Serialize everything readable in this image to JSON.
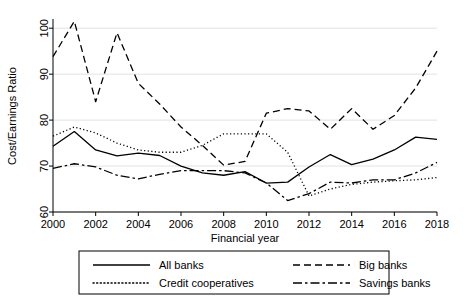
{
  "chart_data": {
    "type": "line",
    "title": "",
    "subtitle": "",
    "xlabel": "Financial year",
    "ylabel": "Cost/Earnings Ratio",
    "xlim": [
      2000,
      2018
    ],
    "ylim": [
      60,
      102
    ],
    "xticks": [
      2000,
      2002,
      2004,
      2006,
      2008,
      2010,
      2012,
      2014,
      2016,
      2018
    ],
    "yticks": [
      60,
      70,
      80,
      90,
      100
    ],
    "grid": "horizontal",
    "legend_position": "bottom-outside",
    "x": [
      2000,
      2001,
      2002,
      2003,
      2004,
      2005,
      2006,
      2007,
      2008,
      2009,
      2010,
      2011,
      2012,
      2013,
      2014,
      2015,
      2016,
      2017,
      2018
    ],
    "series": [
      {
        "name": "All banks",
        "style": "solid",
        "values": [
          74.3,
          77.5,
          73.5,
          72.2,
          72.8,
          72.3,
          70.0,
          68.5,
          68.0,
          68.8,
          66.3,
          66.5,
          69.8,
          72.5,
          70.3,
          71.5,
          73.5,
          76.3,
          75.8
        ]
      },
      {
        "name": "Big banks",
        "style": "dashed",
        "values": [
          93.8,
          101.5,
          84.0,
          99.0,
          88.0,
          83.5,
          78.5,
          74.5,
          70.2,
          71.0,
          81.5,
          82.5,
          82.0,
          78.0,
          82.5,
          78.0,
          81.0,
          87.0,
          95.0
        ]
      },
      {
        "name": "Credit cooperatives",
        "style": "dotted",
        "values": [
          76.5,
          78.5,
          77.2,
          75.0,
          73.5,
          73.0,
          73.0,
          74.5,
          77.0,
          77.0,
          77.0,
          73.0,
          63.5,
          65.0,
          66.0,
          66.5,
          66.8,
          67.0,
          67.5
        ]
      },
      {
        "name": "Savings banks",
        "style": "dashdot",
        "values": [
          69.5,
          70.5,
          69.8,
          68.0,
          67.2,
          68.2,
          69.0,
          69.0,
          69.0,
          68.5,
          66.3,
          62.5,
          64.0,
          66.5,
          66.3,
          67.0,
          67.0,
          68.5,
          70.8
        ]
      }
    ]
  },
  "legend": {
    "entries": [
      {
        "label": "All banks",
        "style": "solid"
      },
      {
        "label": "Big banks",
        "style": "dashed"
      },
      {
        "label": "Credit cooperatives",
        "style": "dotted"
      },
      {
        "label": "Savings banks",
        "style": "dashdot"
      }
    ]
  },
  "axes": {
    "y_tick_labels": [
      "60",
      "70",
      "80",
      "90",
      "100"
    ],
    "x_tick_labels": [
      "2000",
      "2002",
      "2004",
      "2006",
      "2008",
      "2010",
      "2012",
      "2014",
      "2016",
      "2018"
    ],
    "x_title": "Financial year",
    "y_title": "Cost/Earnings Ratio"
  },
  "colors": {
    "line": "#000000",
    "grid": "#d9d9d9",
    "background": "#ffffff"
  }
}
